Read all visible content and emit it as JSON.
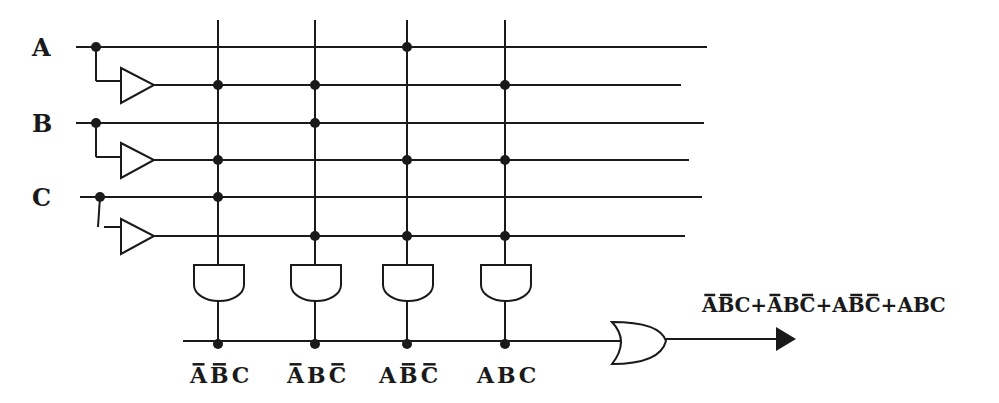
{
  "inputs": [
    {
      "name": "A",
      "line_y": 47,
      "inv_line_y": 85,
      "line_end": 707,
      "inv_line_end": 681
    },
    {
      "name": "B",
      "line_y": 123,
      "inv_line_y": 160,
      "line_end": 704,
      "inv_line_end": 689
    },
    {
      "name": "C",
      "line_y": 197,
      "inv_line_y": 236,
      "line_end": 702,
      "inv_line_end": 685
    }
  ],
  "product_columns": [
    {
      "x": 218,
      "connections": [
        "A'",
        "B'",
        "C"
      ],
      "label": [
        {
          "ch": "A",
          "bar": true
        },
        {
          "ch": "B",
          "bar": true
        },
        {
          "ch": "C",
          "bar": false
        }
      ]
    },
    {
      "x": 315,
      "connections": [
        "A'",
        "B",
        "C'"
      ],
      "label": [
        {
          "ch": "A",
          "bar": true
        },
        {
          "ch": "B",
          "bar": false
        },
        {
          "ch": "C",
          "bar": true
        }
      ]
    },
    {
      "x": 407,
      "connections": [
        "A",
        "B'",
        "C'"
      ],
      "label": [
        {
          "ch": "A",
          "bar": false
        },
        {
          "ch": "B",
          "bar": true
        },
        {
          "ch": "C",
          "bar": true
        }
      ]
    },
    {
      "x": 505,
      "connections": [
        "A'",
        "B'",
        "C'"
      ],
      "label": [
        {
          "ch": "A",
          "bar": false
        },
        {
          "ch": "B",
          "bar": false
        },
        {
          "ch": "C",
          "bar": false
        }
      ]
    }
  ],
  "output": {
    "gate": "OR",
    "expression": [
      {
        "ch": "A",
        "bar": true
      },
      {
        "ch": "B",
        "bar": true
      },
      {
        "ch": "C",
        "bar": false
      },
      {
        "ch": " +",
        "bar": false
      },
      {
        "ch": "A",
        "bar": true
      },
      {
        "ch": "B",
        "bar": false
      },
      {
        "ch": "C",
        "bar": true
      },
      {
        "ch": "+",
        "bar": false
      },
      {
        "ch": "A",
        "bar": false
      },
      {
        "ch": "B",
        "bar": true
      },
      {
        "ch": "C",
        "bar": true
      },
      {
        "ch": "+",
        "bar": false
      },
      {
        "ch": "A",
        "bar": false
      },
      {
        "ch": "B",
        "bar": false
      },
      {
        "ch": "C",
        "bar": false
      }
    ],
    "expression_text": "A'B'C + A'BC' + AB'C' + ABC"
  },
  "colors": {
    "ink": "#1a1a1a",
    "background": "#ffffff"
  }
}
